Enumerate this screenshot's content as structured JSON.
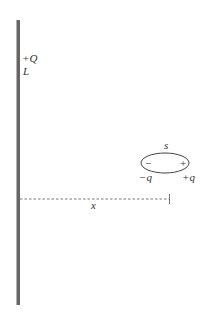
{
  "diagram": {
    "rod": {
      "charge_label": "+Q",
      "length_label": "L",
      "color": "#666666"
    },
    "dipole": {
      "separation_label": "s",
      "negative_sign": "−",
      "positive_sign": "+",
      "negative_charge_label": "−q",
      "positive_charge_label": "+q"
    },
    "distance": {
      "label": "x"
    }
  }
}
